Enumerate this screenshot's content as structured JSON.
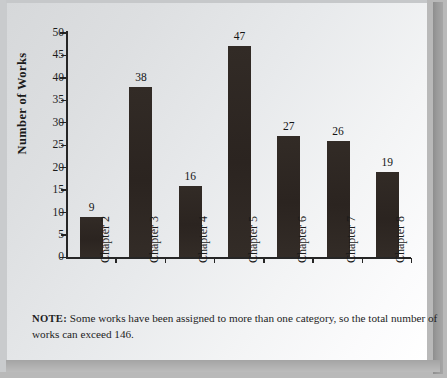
{
  "chart_data": {
    "type": "bar",
    "title": "",
    "xlabel": "",
    "ylabel": "Number of Works",
    "categories": [
      "Chapter 2",
      "Chapter 3",
      "Chapter 4",
      "Chapter 5",
      "Chapter 6",
      "Chapter 7",
      "Chapter 8"
    ],
    "values": [
      9,
      38,
      16,
      47,
      27,
      26,
      19
    ],
    "ylim": [
      0,
      50
    ],
    "ytick_values": [
      0,
      5,
      10,
      15,
      20,
      25,
      30,
      35,
      40,
      45,
      50
    ],
    "ytick_labels": [
      "0",
      "5",
      "10",
      "15",
      "20",
      "25",
      "30",
      "35",
      "40",
      "45",
      "50"
    ],
    "data_labels": [
      "9",
      "38",
      "16",
      "47",
      "27",
      "26",
      "19"
    ],
    "grid": false,
    "legend": null,
    "bar_color": "#2f2823",
    "axis_color": "#262626",
    "text_color": "#1b1b1b"
  },
  "note": {
    "prefix": "NOTE:",
    "text": "Some works have been assigned to more than one category, so the total number of works can exceed 146."
  }
}
